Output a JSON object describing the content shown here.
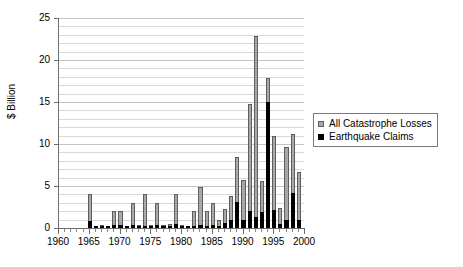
{
  "chart_data": {
    "type": "bar",
    "title": "",
    "subtitle": "",
    "xlabel": "",
    "ylabel": "$ Billion",
    "stacked": true,
    "grid": true,
    "grid_minor_step": 1,
    "legend_position": "right-middle",
    "xlim": [
      1960,
      2000
    ],
    "ylim": [
      0,
      25
    ],
    "ytick_step": 5,
    "ytick_labels": [
      "0",
      "5",
      "10",
      "15",
      "20",
      "25"
    ],
    "ytick_values": [
      0,
      5,
      10,
      15,
      20,
      25
    ],
    "xtick_labels": [
      "1960",
      "1965",
      "1970",
      "1975",
      "1980",
      "1985",
      "1990",
      "1995",
      "2000"
    ],
    "xtick_values": [
      1960,
      1965,
      1970,
      1975,
      1980,
      1985,
      1990,
      1995,
      2000
    ],
    "categories": [
      1965,
      1966,
      1967,
      1968,
      1969,
      1970,
      1971,
      1972,
      1973,
      1974,
      1975,
      1976,
      1977,
      1978,
      1979,
      1980,
      1981,
      1982,
      1983,
      1984,
      1985,
      1986,
      1987,
      1988,
      1989,
      1990,
      1991,
      1992,
      1993,
      1994,
      1995,
      1996,
      1997,
      1998,
      1999
    ],
    "series": [
      {
        "name": "All Catastrophe Losses",
        "color": "#a8a8a8",
        "values": [
          4.0,
          0.2,
          0.4,
          0.15,
          2.0,
          2.0,
          0.2,
          3.0,
          0.3,
          4.0,
          0.4,
          3.0,
          0.3,
          0.5,
          4.0,
          0.3,
          0.2,
          2.0,
          4.9,
          2.0,
          3.0,
          1.0,
          2.3,
          3.8,
          8.5,
          5.7,
          14.8,
          22.8,
          5.6,
          17.8,
          11.0,
          2.4,
          9.6,
          11.2,
          6.7
        ]
      },
      {
        "name": "Earthquake Claims",
        "color": "#000000",
        "values": [
          0.8,
          0.05,
          0.08,
          0.05,
          0.3,
          0.35,
          0.05,
          0.35,
          0.1,
          0.25,
          0.1,
          0.3,
          0.12,
          0.2,
          0.5,
          0.1,
          0.05,
          0.25,
          0.3,
          0.25,
          0.35,
          0.2,
          0.6,
          0.9,
          3.1,
          1.0,
          2.0,
          1.3,
          1.9,
          15.0,
          2.2,
          0.5,
          1.0,
          4.2,
          0.9
        ]
      }
    ],
    "annotations": []
  },
  "legend": {
    "entries": [
      {
        "label": "All Catastrophe Losses",
        "swatch": "legend-swatch-gray"
      },
      {
        "label": "Earthquake Claims",
        "swatch": "legend-swatch-black"
      }
    ]
  }
}
